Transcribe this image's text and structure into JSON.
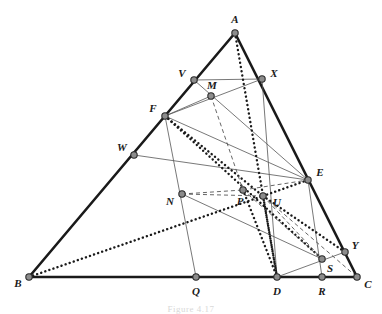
{
  "figure": {
    "caption": "Figure 4.17",
    "width": 382,
    "height": 314,
    "background_color": "#ffffff",
    "stroke_color": "#1a1a1a",
    "thin_stroke_color": "#555555",
    "vertex_fill_color": "#8c8c8c",
    "vertex_stroke_color": "#2a2a2a"
  },
  "points": [
    {
      "id": "A",
      "label": "A",
      "x": 235,
      "y": 33,
      "label_x": 235,
      "label_y": 19,
      "on": "apex"
    },
    {
      "id": "B",
      "label": "B",
      "x": 29,
      "y": 277,
      "label_x": 18,
      "label_y": 283,
      "on": "base-left"
    },
    {
      "id": "C",
      "label": "C",
      "x": 357,
      "y": 277,
      "label_x": 368,
      "label_y": 284,
      "on": "base-right"
    },
    {
      "id": "V",
      "label": "V",
      "x": 194,
      "y": 80,
      "label_x": 182,
      "label_y": 73,
      "on": "AB"
    },
    {
      "id": "X",
      "label": "X",
      "x": 262,
      "y": 79,
      "label_x": 274,
      "label_y": 73,
      "on": "AC"
    },
    {
      "id": "M",
      "label": "M",
      "x": 211,
      "y": 96,
      "label_x": 212,
      "label_y": 85,
      "on": "interior"
    },
    {
      "id": "F",
      "label": "F",
      "x": 165,
      "y": 116,
      "label_x": 153,
      "label_y": 108,
      "on": "AB"
    },
    {
      "id": "W",
      "label": "W",
      "x": 134,
      "y": 155,
      "label_x": 122,
      "label_y": 147,
      "on": "AB"
    },
    {
      "id": "E",
      "label": "E",
      "x": 308,
      "y": 180,
      "label_x": 320,
      "label_y": 172,
      "on": "AC"
    },
    {
      "id": "N",
      "label": "N",
      "x": 182,
      "y": 194,
      "label_x": 170,
      "label_y": 201,
      "on": "interior"
    },
    {
      "id": "P",
      "label": "P",
      "x": 243,
      "y": 190,
      "label_x": 240,
      "label_y": 201,
      "on": "interior"
    },
    {
      "id": "U",
      "label": "U",
      "x": 263,
      "y": 196,
      "label_x": 277,
      "label_y": 202,
      "on": "interior"
    },
    {
      "id": "Y",
      "label": "Y",
      "x": 345,
      "y": 252,
      "label_x": 355,
      "label_y": 245,
      "on": "AC"
    },
    {
      "id": "S",
      "label": "S",
      "x": 322,
      "y": 259,
      "label_x": 330,
      "label_y": 268,
      "on": "interior"
    },
    {
      "id": "Q",
      "label": "Q",
      "x": 196,
      "y": 277,
      "label_x": 196,
      "label_y": 291,
      "on": "BC"
    },
    {
      "id": "D",
      "label": "D",
      "x": 277,
      "y": 277,
      "label_x": 277,
      "label_y": 291,
      "on": "BC"
    },
    {
      "id": "R",
      "label": "R",
      "x": 322,
      "y": 277,
      "label_x": 322,
      "label_y": 291,
      "on": "BC"
    }
  ],
  "segments": [
    {
      "name": "side-AB",
      "from": "A",
      "to": "B",
      "style": "thick"
    },
    {
      "name": "side-AC",
      "from": "A",
      "to": "C",
      "style": "thick"
    },
    {
      "name": "side-BC",
      "from": "B",
      "to": "C",
      "style": "thick"
    },
    {
      "name": "cevian-F-Q",
      "from": "F",
      "to": "Q",
      "style": "thin"
    },
    {
      "name": "cevian-V-E",
      "from": "V",
      "to": "E",
      "style": "thin"
    },
    {
      "name": "cevian-W-E",
      "from": "W",
      "to": "E",
      "style": "thin"
    },
    {
      "name": "cevian-F-X",
      "from": "F",
      "to": "X",
      "style": "thin"
    },
    {
      "name": "line-V-X",
      "from": "V",
      "to": "X",
      "style": "thin"
    },
    {
      "name": "line-F-E",
      "from": "F",
      "to": "E",
      "style": "thin"
    },
    {
      "name": "line-X-D",
      "from": "X",
      "to": "D",
      "style": "thin"
    },
    {
      "name": "line-E-R",
      "from": "E",
      "to": "R",
      "style": "thin"
    },
    {
      "name": "line-D-Y",
      "from": "D",
      "to": "Y",
      "style": "thin"
    },
    {
      "name": "line-N-S",
      "from": "N",
      "to": "S",
      "style": "thin"
    },
    {
      "name": "dotted-A-D",
      "from": "A",
      "to": "D",
      "style": "dotted"
    },
    {
      "name": "dotted-B-U",
      "from": "B",
      "to": "U",
      "style": "dotted"
    },
    {
      "name": "dotted-F-S",
      "from": "F",
      "to": "S",
      "style": "dotted"
    },
    {
      "name": "dotted-F-U",
      "from": "F",
      "to": "U",
      "style": "dotted"
    },
    {
      "name": "dotted-U-D",
      "from": "U",
      "to": "D",
      "style": "dotted"
    },
    {
      "name": "dotted-U-Y",
      "from": "U",
      "to": "Y",
      "style": "dotted"
    },
    {
      "name": "dotted-U-E",
      "from": "U",
      "to": "E",
      "style": "dotted"
    },
    {
      "name": "dotted-P-D",
      "from": "P",
      "to": "D",
      "style": "dotted"
    },
    {
      "name": "dashed-M-P",
      "from": "M",
      "to": "P",
      "style": "dashed"
    },
    {
      "name": "dashed-N-P",
      "from": "N",
      "to": "P",
      "style": "dashed"
    },
    {
      "name": "dashed-P-E",
      "from": "P",
      "to": "E",
      "style": "dashed"
    },
    {
      "name": "dashed-P-S",
      "from": "P",
      "to": "S",
      "style": "dashed"
    },
    {
      "name": "dashed-U-S",
      "from": "U",
      "to": "S",
      "style": "dashed"
    },
    {
      "name": "dashed-U-C",
      "from": "U",
      "to": "C",
      "style": "dashed"
    },
    {
      "name": "dashed-N-U",
      "from": "N",
      "to": "U",
      "style": "dashed"
    },
    {
      "name": "dashed-M-F",
      "from": "M",
      "to": "F",
      "style": "thin"
    }
  ]
}
